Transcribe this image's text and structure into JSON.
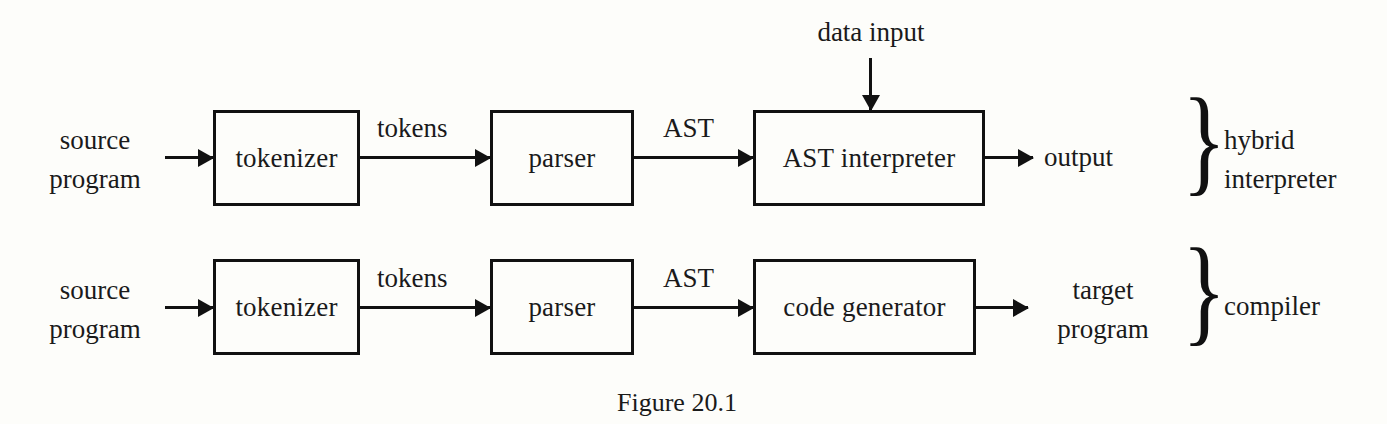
{
  "figure": {
    "caption": "Figure 20.1"
  },
  "rows": [
    {
      "id": "hybrid-interpreter",
      "input_label": "source\nprogram",
      "input_line1": "source",
      "input_line2": "program",
      "stages": [
        {
          "label": "tokenizer"
        },
        {
          "label": "parser"
        },
        {
          "label": "AST interpreter"
        }
      ],
      "edges": [
        {
          "label": "tokens"
        },
        {
          "label": "AST"
        }
      ],
      "side_input": {
        "label": "data input"
      },
      "output_line1": "output",
      "output_line2": "",
      "group_label_line1": "hybrid",
      "group_label_line2": "interpreter",
      "brace": "}"
    },
    {
      "id": "compiler",
      "input_label": "source\nprogram",
      "input_line1": "source",
      "input_line2": "program",
      "stages": [
        {
          "label": "tokenizer"
        },
        {
          "label": "parser"
        },
        {
          "label": "code generator"
        }
      ],
      "edges": [
        {
          "label": "tokens"
        },
        {
          "label": "AST"
        }
      ],
      "output_line1": "target",
      "output_line2": "program",
      "group_label_line1": "compiler",
      "group_label_line2": "",
      "brace": "}"
    }
  ],
  "colors": {
    "stroke": "#111111",
    "background": "#fdfdfa",
    "text": "#1a1a1a"
  }
}
